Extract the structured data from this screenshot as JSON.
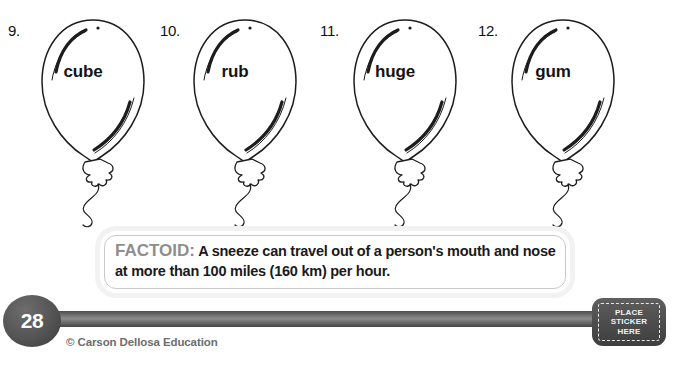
{
  "page": {
    "number": "28",
    "copyright": "© Carson Dellosa Education"
  },
  "exercises": {
    "items": [
      {
        "number": "9.",
        "word": "cube"
      },
      {
        "number": "10.",
        "word": "rub"
      },
      {
        "number": "11.",
        "word": "huge"
      },
      {
        "number": "12.",
        "word": "gum"
      }
    ]
  },
  "factoid": {
    "label": "FACTOID:",
    "text": " A sneeze can travel out of a person's mouth and nose at more than 100 miles (160 km) per hour."
  },
  "sticker": {
    "line1": "PLACE",
    "line2": "STICKER",
    "line3": "HERE"
  },
  "colors": {
    "bar_dark": "#4d4d4d",
    "bar_light": "#8b8b8b",
    "factoid_label": "#8e8e8e",
    "ink": "#141414",
    "copyright": "#6d6d6d"
  }
}
